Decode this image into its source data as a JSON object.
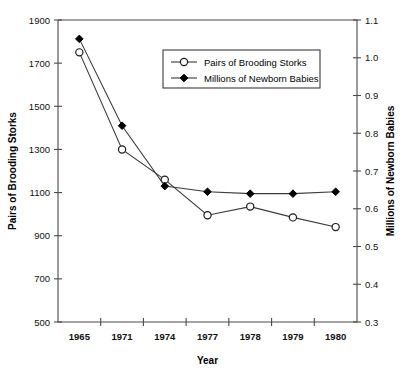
{
  "title_sliver": "",
  "chart_data": {
    "type": "line",
    "title": "",
    "xlabel": "Year",
    "categories": [
      "1965",
      "1971",
      "1974",
      "1977",
      "1978",
      "1979",
      "1980"
    ],
    "grid": false,
    "legend_position": "upper-center-right",
    "axes": {
      "left": {
        "label": "Pairs of Brooding Storks",
        "min": 500,
        "max": 1900,
        "step": 200,
        "ticks": [
          500,
          700,
          900,
          1100,
          1300,
          1500,
          1700,
          1900
        ],
        "tick_labels": [
          "500",
          "700",
          "900",
          "1100",
          "1300",
          "1500",
          "1700",
          "1900"
        ]
      },
      "right": {
        "label": "Millions of Newborn Babies",
        "min": 0.3,
        "max": 1.1,
        "step": 0.1,
        "ticks": [
          0.3,
          0.4,
          0.5,
          0.6,
          0.7,
          0.8,
          0.9,
          1.0,
          1.1
        ],
        "tick_labels": [
          "0.3",
          "0.4",
          "0.5",
          "0.6",
          "0.7",
          "0.8",
          "0.9",
          "1.0",
          "1.1"
        ]
      }
    },
    "series": [
      {
        "name": "Pairs of Brooding Storks",
        "axis": "left",
        "marker": "open-circle",
        "values": [
          1750,
          1300,
          1160,
          995,
          1035,
          985,
          940
        ]
      },
      {
        "name": "Millions of Newborn Babies",
        "axis": "right",
        "marker": "filled-diamond",
        "values": [
          1.05,
          0.82,
          0.66,
          0.645,
          0.64,
          0.64,
          0.645
        ]
      }
    ],
    "legend": [
      {
        "label": "Pairs of Brooding Storks",
        "marker": "open-circle"
      },
      {
        "label": "Millions of Newborn Babies",
        "marker": "filled-diamond"
      }
    ]
  }
}
